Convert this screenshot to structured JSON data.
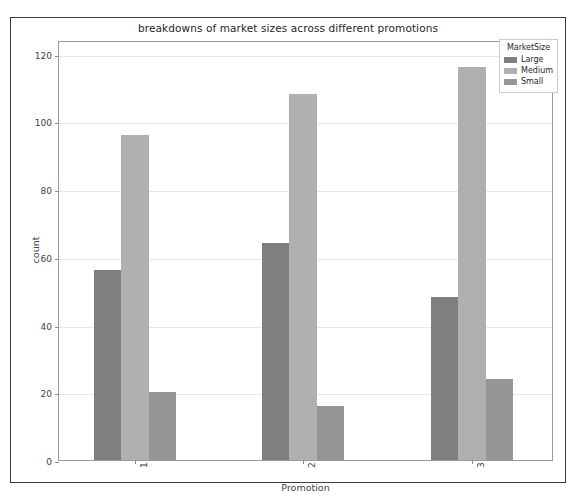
{
  "chart_data": {
    "type": "bar",
    "title": "breakdowns of market sizes across different promotions",
    "xlabel": "Promotion",
    "ylabel": "count",
    "categories": [
      "1",
      "2",
      "3"
    ],
    "series": [
      {
        "name": "Large",
        "color": "#7f7f7f",
        "values": [
          56,
          64,
          48
        ]
      },
      {
        "name": "Medium",
        "color": "#b0b0b0",
        "values": [
          96,
          108,
          116
        ]
      },
      {
        "name": "Small",
        "color": "#969696",
        "values": [
          20,
          16,
          24
        ]
      }
    ],
    "legend_title": "MarketSize",
    "legend_position": "upper right",
    "ylim": [
      0,
      124
    ],
    "yticks": [
      0,
      20,
      40,
      60,
      80,
      100,
      120
    ],
    "ytick_labels": [
      "0",
      "20",
      "40",
      "60",
      "80",
      "100",
      "120"
    ],
    "grid": true,
    "xtick_rotation": -90
  }
}
